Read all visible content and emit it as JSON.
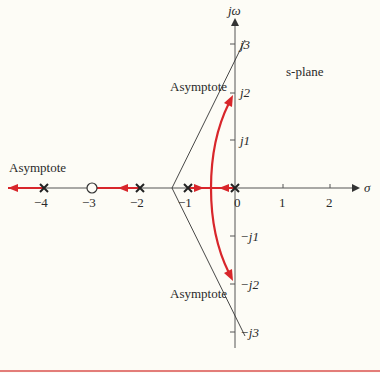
{
  "diagram": {
    "type": "root-locus",
    "plane_label": "s-plane",
    "axes": {
      "real_label": "σ",
      "imag_label": "jω",
      "real_ticks": [
        "−4",
        "−3",
        "−2",
        "−1",
        "0",
        "1",
        "2"
      ],
      "imag_ticks_pos": [
        "j1",
        "j2",
        "j3"
      ],
      "imag_ticks_neg": [
        "−j1",
        "−j2",
        "−j3"
      ]
    },
    "poles": [
      0,
      -1,
      -2,
      -4
    ],
    "zeros": [
      -3
    ],
    "asymptote_label": "Asymptote",
    "asymptote_centroid": -1.33,
    "asymptote_angles_deg": [
      60,
      180,
      300
    ],
    "breakaway_point": -0.5,
    "colors": {
      "locus": "#d8262b",
      "axis": "#333333",
      "background": "#fdfcf6",
      "rule": "#d9534f"
    }
  }
}
